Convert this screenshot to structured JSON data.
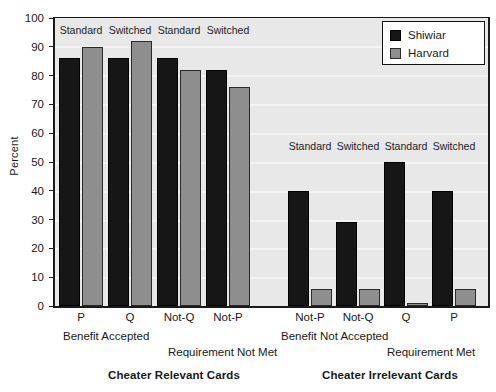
{
  "chart_data": {
    "type": "bar",
    "title": "",
    "xlabel": "",
    "ylabel": "Percent",
    "ylim": [
      0,
      100
    ],
    "yticks": [
      0,
      10,
      20,
      30,
      40,
      50,
      60,
      70,
      80,
      90,
      100
    ],
    "grid": true,
    "legend_position": "top-right",
    "categories": [
      "P",
      "Q",
      "Not-Q",
      "Not-P",
      "Not-P",
      "Not-Q",
      "Q",
      "P"
    ],
    "series": [
      {
        "name": "Shiwiar",
        "color": "#161616",
        "values": [
          86,
          86,
          86,
          82,
          40,
          29,
          50,
          40
        ]
      },
      {
        "name": "Harvard",
        "color": "#8e8e8e",
        "values": [
          90,
          92,
          82,
          76,
          6,
          6,
          1,
          6
        ]
      }
    ],
    "in_plot_captions": [
      "Standard",
      "Switched",
      "Standard",
      "Switched",
      "Standard",
      "Switched",
      "Standard",
      "Switched"
    ],
    "annotations": [
      "Benefit Accepted",
      "Requirement Not Met",
      "Benefit Not Accepted",
      "Requirement Met"
    ],
    "group_titles": [
      "Cheater Relevant Cards",
      "Cheater Irrelevant Cards"
    ]
  },
  "axis": {
    "ylabel": "Percent",
    "yticks": [
      "100",
      "90",
      "80",
      "70",
      "60",
      "50",
      "40",
      "30",
      "20",
      "10",
      "0"
    ]
  },
  "legend": {
    "entries": [
      {
        "label": "Shiwiar",
        "color": "#161616"
      },
      {
        "label": "Harvard",
        "color": "#8e8e8e"
      }
    ]
  },
  "xcats": [
    {
      "label": "P"
    },
    {
      "label": "Q"
    },
    {
      "label": "Not-Q"
    },
    {
      "label": "Not-P"
    },
    {
      "label": "Not-P"
    },
    {
      "label": "Not-Q"
    },
    {
      "label": "Q"
    },
    {
      "label": "P"
    }
  ],
  "captions": {
    "c0": "Standard",
    "c1": "Switched",
    "c2": "Standard",
    "c3": "Switched",
    "c4": "Standard",
    "c5": "Switched",
    "c6": "Standard",
    "c7": "Switched"
  },
  "annotations": {
    "benefit_accepted": "Benefit Accepted",
    "requirement_not_met": "Requirement Not Met",
    "benefit_not_accepted": "Benefit Not Accepted",
    "requirement_met": "Requirement Met"
  },
  "group_titles": {
    "left": "Cheater Relevant Cards",
    "right": "Cheater Irrelevant Cards"
  }
}
